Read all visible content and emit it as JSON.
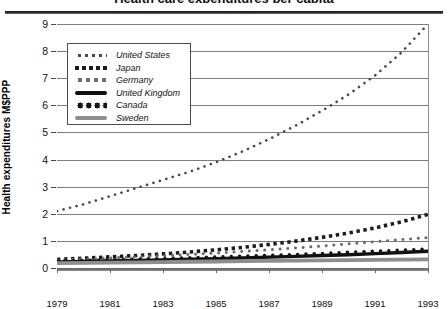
{
  "title": "Health care expenditures per capita",
  "axis": {
    "y_caption": "Health expenditures M$PPP",
    "y_ticks": [
      "0",
      "1",
      "2",
      "3",
      "4",
      "5",
      "6",
      "7",
      "8",
      "9"
    ],
    "x_ticks": [
      "1979",
      "1981",
      "1983",
      "1985",
      "1987",
      "1989",
      "1991",
      "1993"
    ]
  },
  "legend": {
    "items": [
      {
        "label": "United States",
        "style": "sw-dotfine",
        "color": "#4a4a4a"
      },
      {
        "label": "Japan",
        "style": "sw-dotsq",
        "color": "#1c1c1c"
      },
      {
        "label": "Germany",
        "style": "sw-dotmid",
        "color": "#6d6d6d"
      },
      {
        "label": "United Kingdom",
        "style": "sw-solidblack",
        "color": "#111111"
      },
      {
        "label": "Canada",
        "style": "sw-dotbig",
        "color": "#141414"
      },
      {
        "label": "Sweden",
        "style": "sw-solidgray",
        "color": "#8e8e8e"
      }
    ]
  },
  "chart_data": {
    "type": "line",
    "title": "Health care expenditures per capita",
    "xlabel": "",
    "ylabel": "Health expenditures M$PPP",
    "xlim": [
      1979,
      1993
    ],
    "ylim": [
      0,
      9
    ],
    "grid": true,
    "legend_position": "upper-left-inside",
    "x": [
      1979,
      1980,
      1981,
      1982,
      1983,
      1984,
      1985,
      1986,
      1987,
      1988,
      1989,
      1990,
      1991,
      1992,
      1993
    ],
    "series": [
      {
        "name": "United States",
        "values": [
          2.1,
          2.35,
          2.65,
          2.95,
          3.25,
          3.55,
          3.9,
          4.3,
          4.75,
          5.25,
          5.8,
          6.4,
          7.1,
          7.95,
          9.0
        ]
      },
      {
        "name": "Japan",
        "values": [
          0.32,
          0.36,
          0.41,
          0.46,
          0.52,
          0.59,
          0.67,
          0.76,
          0.87,
          0.99,
          1.13,
          1.29,
          1.48,
          1.7,
          1.98
        ]
      },
      {
        "name": "Germany",
        "values": [
          0.3,
          0.33,
          0.37,
          0.41,
          0.45,
          0.5,
          0.55,
          0.61,
          0.67,
          0.74,
          0.81,
          0.89,
          0.97,
          1.05,
          1.12
        ]
      },
      {
        "name": "United Kingdom",
        "values": [
          0.22,
          0.24,
          0.26,
          0.28,
          0.3,
          0.32,
          0.34,
          0.37,
          0.4,
          0.43,
          0.46,
          0.49,
          0.53,
          0.57,
          0.62
        ]
      },
      {
        "name": "Canada",
        "values": [
          0.26,
          0.28,
          0.3,
          0.33,
          0.35,
          0.38,
          0.41,
          0.44,
          0.47,
          0.5,
          0.54,
          0.58,
          0.62,
          0.66,
          0.7
        ]
      },
      {
        "name": "Sweden",
        "values": [
          0.18,
          0.19,
          0.2,
          0.21,
          0.22,
          0.23,
          0.24,
          0.25,
          0.26,
          0.27,
          0.28,
          0.29,
          0.3,
          0.31,
          0.32
        ]
      }
    ]
  },
  "series_render": [
    {
      "name": "United States",
      "pattern": "dotfine",
      "color": "#4a4a4a",
      "dot": 2.5,
      "gap": 6.6,
      "width": 2.6
    },
    {
      "name": "Japan",
      "pattern": "square",
      "color": "#1c1c1c",
      "dot": 3.4,
      "gap": 7.0,
      "width": 3.6
    },
    {
      "name": "Germany",
      "pattern": "dotmid",
      "color": "#6d6d6d",
      "dot": 2.9,
      "gap": 7.6,
      "width": 3.0
    },
    {
      "name": "United Kingdom",
      "pattern": "solid",
      "color": "#111111",
      "dot": 0,
      "gap": 0,
      "width": 3.4
    },
    {
      "name": "Canada",
      "pattern": "dotbig",
      "color": "#141414",
      "dot": 3.2,
      "gap": 8.2,
      "width": 3.4
    },
    {
      "name": "Sweden",
      "pattern": "solid",
      "color": "#8e8e8e",
      "dot": 0,
      "gap": 0,
      "width": 3.8
    }
  ]
}
